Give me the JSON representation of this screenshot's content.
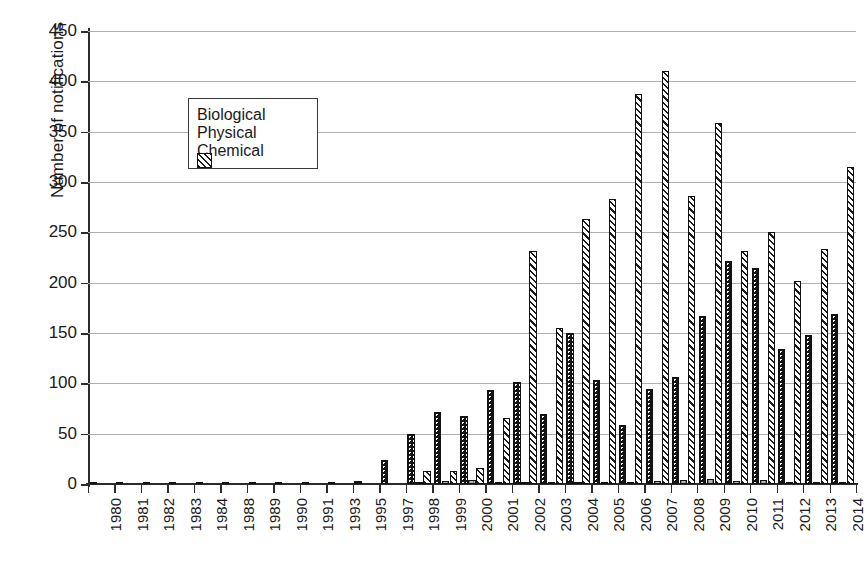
{
  "chart_data": {
    "type": "bar",
    "title": "",
    "xlabel": "",
    "ylabel": "Number of notifications",
    "ylim": [
      0,
      450
    ],
    "ytick_step": 50,
    "yticks": [
      0,
      50,
      100,
      150,
      200,
      250,
      300,
      350,
      400,
      450
    ],
    "grid": "horizontal",
    "legend_position": "upper-left-inside",
    "categories": [
      "1980",
      "1981",
      "1982",
      "1983",
      "1984",
      "1988",
      "1989",
      "1990",
      "1991",
      "1993",
      "1995",
      "1997",
      "1998",
      "1999",
      "2000",
      "2001",
      "2002",
      "2003",
      "2004",
      "2005",
      "2006",
      "2007",
      "2008",
      "2009",
      "2010",
      "2011",
      "2012",
      "2013",
      "2014"
    ],
    "series": [
      {
        "name": "Biological",
        "color": "#141414",
        "pattern": "dotted",
        "values": [
          2,
          1,
          2,
          2,
          2,
          2,
          2,
          2,
          2,
          2,
          3,
          24,
          50,
          72,
          68,
          93,
          101,
          70,
          150,
          103,
          59,
          94,
          106,
          167,
          222,
          215,
          134,
          148,
          169
        ]
      },
      {
        "name": "Physical",
        "color": "#b5b5b5",
        "pattern": "solid-gray",
        "values": [
          0,
          0,
          0,
          0,
          0,
          0,
          0,
          0,
          0,
          0,
          0,
          0,
          2,
          3,
          4,
          1,
          1,
          1,
          1,
          1,
          2,
          3,
          4,
          5,
          3,
          4,
          2,
          1,
          1
        ]
      },
      {
        "name": "Chemical",
        "color": "#f2f2f2",
        "pattern": "diagonal-hatch",
        "values": [
          0,
          0,
          0,
          0,
          0,
          0,
          0,
          0,
          0,
          0,
          0,
          0,
          13,
          13,
          16,
          66,
          231,
          155,
          263,
          283,
          387,
          410,
          286,
          359,
          231,
          250,
          202,
          233,
          315
        ]
      }
    ]
  },
  "legend": {
    "items": [
      {
        "label": "Biological",
        "swatch": "biological-swatch"
      },
      {
        "label": "Physical",
        "swatch": "physical-swatch"
      },
      {
        "label": "Chemical",
        "swatch": "chemical-swatch"
      }
    ]
  },
  "axes": {
    "y_title": "Number of notifications"
  }
}
